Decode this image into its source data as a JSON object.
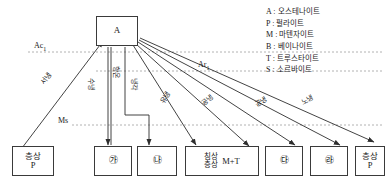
{
  "diagram": {
    "source_box": {
      "label": "A"
    },
    "critical_lines": [
      {
        "id": "Ac1",
        "label": "Ac",
        "sub": "1"
      },
      {
        "id": "Ar1",
        "label": "Ar",
        "sub": "1"
      },
      {
        "id": "Ms",
        "label": "Ms",
        "sub": ""
      }
    ],
    "path_labels": [
      {
        "id": "slow-cool",
        "text": "서냉"
      },
      {
        "id": "water-cool",
        "text": "수냉"
      },
      {
        "id": "isothermal",
        "text": "항온"
      },
      {
        "id": "isothermal-cool",
        "text": "냉각"
      },
      {
        "id": "oil-cool",
        "text": "유냉"
      },
      {
        "id": "air-cool",
        "text": "공냉"
      },
      {
        "id": "air-cool-2",
        "text": "공냉"
      },
      {
        "id": "furnace-cool",
        "text": "노냉"
      }
    ],
    "result_boxes": [
      {
        "id": "box-1",
        "line1": "층상",
        "line2": "P",
        "kind": "two-line"
      },
      {
        "id": "box-2",
        "mark": "㉮",
        "kind": "circled"
      },
      {
        "id": "box-3",
        "mark": "㉯",
        "kind": "circled"
      },
      {
        "id": "box-4",
        "line1": "침상",
        "line2": "층상",
        "label": "M+T",
        "kind": "mt"
      },
      {
        "id": "box-5",
        "mark": "㉰",
        "kind": "circled"
      },
      {
        "id": "box-6",
        "mark": "㉱",
        "kind": "circled"
      },
      {
        "id": "box-7",
        "line1": "층상",
        "line2": "P",
        "kind": "two-line"
      }
    ],
    "legend": {
      "entries": [
        {
          "symbol": "A",
          "name": "오스테나이트"
        },
        {
          "symbol": "P",
          "name": "펄라이트"
        },
        {
          "symbol": "M",
          "name": "마텐자이트"
        },
        {
          "symbol": "B",
          "name": "베이나이트"
        },
        {
          "symbol": "T",
          "name": "트루스타이트"
        },
        {
          "symbol": "S",
          "name": "소르바이트"
        }
      ],
      "separator": ":"
    },
    "colors": {
      "stroke": "#3a3a3a",
      "dashed": "#9a9a9a",
      "background": "#ffffff",
      "text": "#1a1a1a"
    }
  }
}
